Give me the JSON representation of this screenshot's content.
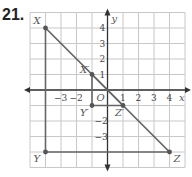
{
  "problem": {
    "number": "21."
  },
  "graph": {
    "x_axis_label": "x",
    "y_axis_label": "y",
    "origin_label": "O",
    "x_ticks": [
      {
        "value": -3,
        "label": "−3"
      },
      {
        "value": -2,
        "label": "−2"
      },
      {
        "value": 1,
        "label": "1"
      },
      {
        "value": 2,
        "label": "2"
      },
      {
        "value": 3,
        "label": "3"
      },
      {
        "value": 4,
        "label": "4"
      }
    ],
    "y_ticks": [
      {
        "value": 4,
        "label": "4"
      },
      {
        "value": 3,
        "label": "3"
      },
      {
        "value": 2,
        "label": "2"
      },
      {
        "value": 1,
        "label": "1"
      },
      {
        "value": -2,
        "label": "−2"
      },
      {
        "value": -3,
        "label": "−3"
      }
    ],
    "range": {
      "xmin": -5,
      "xmax": 5,
      "ymin": -5,
      "ymax": 5
    },
    "points": [
      {
        "name": "X",
        "label": "X",
        "x": -4,
        "y": 4
      },
      {
        "name": "Y",
        "label": "Y",
        "x": -4,
        "y": -4
      },
      {
        "name": "Z",
        "label": "Z",
        "x": 4,
        "y": -4
      },
      {
        "name": "X'",
        "label": "X′",
        "x": -1,
        "y": 1
      },
      {
        "name": "Y'",
        "label": "Y′",
        "x": -1,
        "y": -1
      },
      {
        "name": "Z'",
        "label": "Z′",
        "x": 1,
        "y": -1
      }
    ],
    "triangles": [
      {
        "name": "XYZ",
        "vertices": [
          "X",
          "Y",
          "Z"
        ]
      },
      {
        "name": "X'Y'Z'",
        "vertices": [
          "X'",
          "Y'",
          "Z'"
        ]
      }
    ],
    "colors": {
      "grid": "#c8c8c8",
      "axis": "#333333",
      "figure": "#666666",
      "point": "#555555"
    }
  }
}
